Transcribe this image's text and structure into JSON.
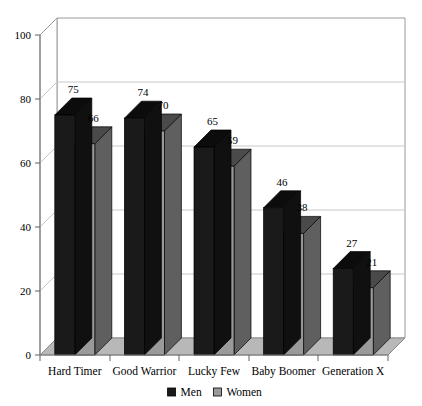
{
  "chart_data": {
    "type": "bar",
    "title": "",
    "subtitle": "",
    "xlabel": "",
    "ylabel": "",
    "categories": [
      "Hard Timer",
      "Good Warrior",
      "Lucky Few",
      "Baby Boomer",
      "Generation X"
    ],
    "series": [
      {
        "name": "Men",
        "color": "#1a1a1a",
        "values": [
          75,
          74,
          65,
          46,
          27
        ]
      },
      {
        "name": "Women",
        "color": "#9a9a9a",
        "values": [
          66,
          70,
          59,
          38,
          21
        ]
      }
    ],
    "ylim": [
      0,
      100
    ],
    "yticks": [
      0,
      20,
      40,
      60,
      80,
      100
    ],
    "ytick_labels": [
      "0",
      "20",
      "40",
      "60",
      "80",
      "100"
    ],
    "grid": true,
    "grid_axis": "y",
    "legend_position": "bottom-center",
    "projection": "3d",
    "value_labels": true,
    "background_color": "#ffffff",
    "plot_area_color": "#ffffff",
    "floor_color": "#b8b8b8",
    "axis_color": "#808080",
    "grid_color": "#c8c8c8"
  },
  "legend": {
    "items": [
      {
        "label": "Men",
        "swatch": "#1a1a1a"
      },
      {
        "label": "Women",
        "swatch": "#9a9a9a"
      }
    ]
  }
}
